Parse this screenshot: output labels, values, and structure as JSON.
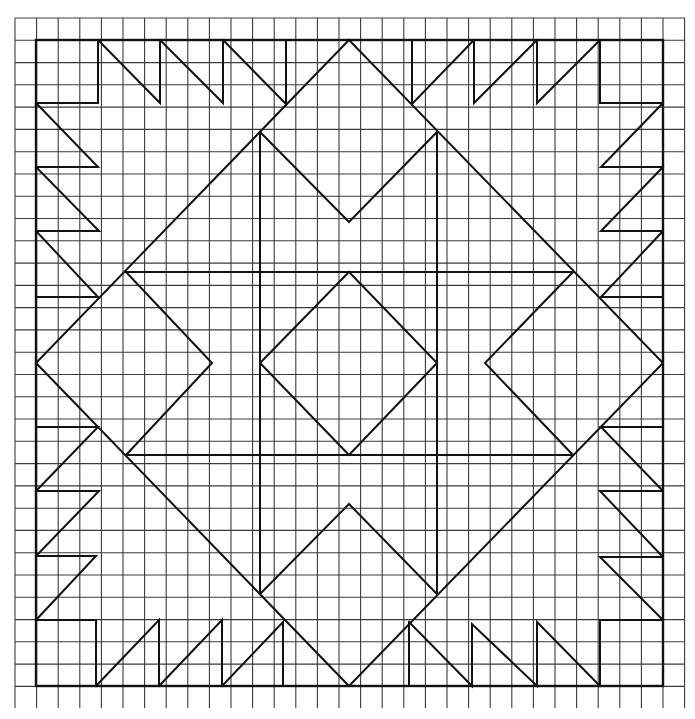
{
  "diagram": {
    "type": "quilt-block-pattern-on-graph-paper",
    "background": "#ffffff",
    "line_color": "#111111",
    "grid": {
      "x_start": 15,
      "x_end": 685,
      "x_step": 21.6,
      "y_start": 18,
      "y_end": 708,
      "y_step": 22.28
    },
    "border": {
      "x1": 36,
      "y1": 40,
      "x2": 663,
      "y2": 686
    },
    "polylines": [
      {
        "name": "large-diamond",
        "points": "349,40 663,363 349,686 36,363 349,40"
      },
      {
        "name": "center-band-top",
        "points": "126,272 573,272"
      },
      {
        "name": "center-band-bottom",
        "points": "126,455 573,455"
      },
      {
        "name": "center-column-left",
        "points": "260,132 260,594"
      },
      {
        "name": "center-column-right",
        "points": "437,132 437,594"
      },
      {
        "name": "center-diamond",
        "points": "349,272 437,363 349,455 260,363 349,272"
      },
      {
        "name": "top-v",
        "points": "260,132 349,222 437,132"
      },
      {
        "name": "bottom-v",
        "points": "260,594 349,504 437,594"
      },
      {
        "name": "left-v",
        "points": "126,272 212,363 126,455"
      },
      {
        "name": "right-v",
        "points": "573,272 485,363 573,455"
      },
      {
        "name": "top-left-corner",
        "points": "36,103 98,103 98,40"
      },
      {
        "name": "top-left-tooth-1",
        "points": "98,40 160,103 160,40"
      },
      {
        "name": "top-left-tooth-2",
        "points": "160,40 223,103 223,40"
      },
      {
        "name": "top-left-tooth-3",
        "points": "223,40 286,104 286,40"
      },
      {
        "name": "top-right-tooth-3",
        "points": "412,40 412,104 474,40"
      },
      {
        "name": "top-right-tooth-2",
        "points": "474,40 474,103 537,40"
      },
      {
        "name": "top-right-tooth-1",
        "points": "537,40 537,103 600,40"
      },
      {
        "name": "top-right-corner",
        "points": "600,40 600,103 663,103"
      },
      {
        "name": "left-top-tooth-1",
        "points": "36,103 98,167 36,167"
      },
      {
        "name": "left-top-tooth-2",
        "points": "36,167 99,231 36,231"
      },
      {
        "name": "left-top-tooth-3",
        "points": "36,231 98,297 36,297"
      },
      {
        "name": "right-top-tooth-1",
        "points": "663,103 601,167 663,167"
      },
      {
        "name": "right-top-tooth-2",
        "points": "663,167 601,231 663,231"
      },
      {
        "name": "right-top-tooth-3",
        "points": "663,231 601,297 663,297"
      },
      {
        "name": "left-bottom-tooth-3",
        "points": "36,427 98,427 36,491"
      },
      {
        "name": "left-bottom-tooth-2",
        "points": "36,491 99,491 36,556"
      },
      {
        "name": "left-bottom-tooth-1",
        "points": "36,556 96,556 36,620"
      },
      {
        "name": "bottom-left-corner",
        "points": "36,620 96,620 96,686"
      },
      {
        "name": "right-bottom-tooth-3",
        "points": "663,427 601,427 663,491"
      },
      {
        "name": "right-bottom-tooth-2",
        "points": "663,491 600,491 663,557"
      },
      {
        "name": "right-bottom-tooth-1",
        "points": "663,557 600,557 663,620"
      },
      {
        "name": "bottom-right-corner",
        "points": "663,620 600,620 600,686"
      },
      {
        "name": "bottom-left-tooth-1",
        "points": "96,686 159,620 159,686"
      },
      {
        "name": "bottom-left-tooth-2",
        "points": "159,686 222,620 222,686"
      },
      {
        "name": "bottom-left-tooth-3",
        "points": "222,686 283,622 283,686"
      },
      {
        "name": "bottom-right-tooth-3",
        "points": "409,622 409,686"
      },
      {
        "name": "bottom-right-tooth-3b",
        "points": "409,622 472,686 472,624 537,686 537,622 600,686"
      }
    ]
  }
}
